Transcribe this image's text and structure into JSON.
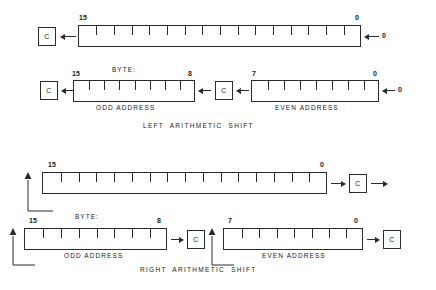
{
  "diagram": {
    "background_color": "#ffffff",
    "line_color": "#2b2b2b"
  },
  "sections": [
    {
      "id": "left-arithmetic-shift",
      "caption": "LEFT   ARITHMETIC   SHIFT",
      "direction": "left",
      "word": {
        "id": "left-shift-word",
        "bits": 16,
        "msb_label": "15",
        "lsb_label": "0",
        "carry": {
          "label": "C",
          "position": "left"
        },
        "fill_in": {
          "label": "0",
          "position": "right",
          "arrow": "left"
        }
      },
      "bytes": {
        "byte_label": "BYTE:",
        "odd": {
          "id": "left-shift-odd-byte",
          "bits": 8,
          "msb_label": "15",
          "lsb_label": "8",
          "under_label": "ODD   ADDRESS",
          "carry": {
            "label": "C",
            "position": "right"
          }
        },
        "even": {
          "id": "left-shift-even-byte",
          "bits": 8,
          "msb_label": "7",
          "lsb_label": "0",
          "under_label": "EVEN   ADDRESS",
          "carry": {
            "label": "C",
            "position": "left"
          },
          "fill_in": {
            "label": "0",
            "position": "right",
            "arrow": "left"
          }
        }
      }
    },
    {
      "id": "right-arithmetic-shift",
      "caption": "RIGHT   ARITHMETIC   SHIFT",
      "direction": "right",
      "word": {
        "id": "right-shift-word",
        "bits": 16,
        "msb_label": "15",
        "lsb_label": "0",
        "carry": {
          "label": "C",
          "position": "right"
        },
        "sign_extend_loop": true
      },
      "bytes": {
        "byte_label": "BYTE:",
        "odd": {
          "id": "right-shift-odd-byte",
          "bits": 8,
          "msb_label": "15",
          "lsb_label": "8",
          "under_label": "ODD   ADDRESS",
          "carry": {
            "label": "C",
            "position": "right"
          },
          "sign_extend_loop": true
        },
        "even": {
          "id": "right-shift-even-byte",
          "bits": 8,
          "msb_label": "7",
          "lsb_label": "0",
          "under_label": "EVEN   ADDRESS",
          "carry": {
            "label": "C",
            "position": "right"
          },
          "sign_extend_loop": true
        }
      }
    }
  ]
}
